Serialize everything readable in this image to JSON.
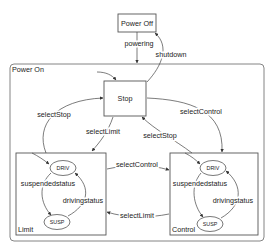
{
  "diagram": {
    "type": "state-machine",
    "states": {
      "power_off": "Power Off",
      "power_on": "Power On",
      "stop": "Stop",
      "limit": "Limit",
      "control": "Control",
      "limit_driv": "DRIV",
      "limit_susp": "SUSP",
      "control_driv": "DRIV",
      "control_susp": "SUSP"
    },
    "transitions": {
      "powering": "powering",
      "shutdown": "shutdown",
      "stop_to_limit": "selectLimit",
      "limit_to_stop": "selectStop",
      "stop_to_control": "selectControl",
      "control_to_stop": "selectStop",
      "limit_to_control": "selectControl",
      "control_to_limit": "selectLimit",
      "limit_driv_to_susp": "suspendedstatus",
      "limit_susp_to_driv": "drivingstatus",
      "control_driv_to_susp": "suspendedstatus",
      "control_susp_to_driv": "drivingstatus"
    }
  }
}
